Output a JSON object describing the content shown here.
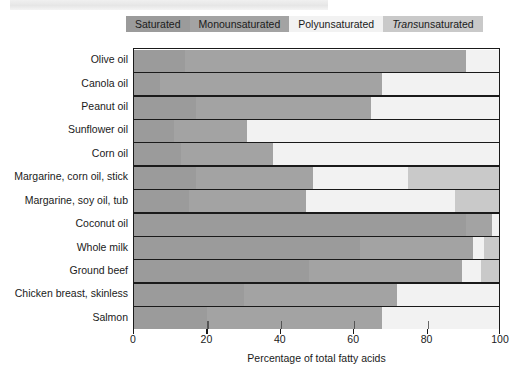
{
  "banner": {
    "present": true
  },
  "legend": {
    "items": [
      {
        "key": "saturated",
        "label": "Saturated",
        "color": "#9b9b9b",
        "italic_prefix": ""
      },
      {
        "key": "monounsaturated",
        "label": "Monounsaturated",
        "color": "#a3a3a3",
        "italic_prefix": ""
      },
      {
        "key": "polyunsaturated",
        "label": "Polyunsaturated",
        "color": "#f2f2f2",
        "italic_prefix": ""
      },
      {
        "key": "trans",
        "label": " unsaturated",
        "color": "#c9c9c9",
        "italic_prefix": "Trans"
      }
    ]
  },
  "axis": {
    "x_title": "Percentage of total fatty acids",
    "x_ticks": [
      0,
      20,
      40,
      60,
      80,
      100
    ],
    "x_tick_labels": [
      "0",
      "20",
      "40",
      "60",
      "80",
      "100"
    ]
  },
  "chart_data": {
    "type": "bar",
    "orientation": "horizontal",
    "stacked": true,
    "title": "",
    "xlabel": "Percentage of total fatty acids",
    "ylabel": "",
    "xlim": [
      0,
      100
    ],
    "grid": false,
    "legend_position": "top",
    "categories": [
      "Olive oil",
      "Canola oil",
      "Peanut oil",
      "Sunflower oil",
      "Corn oil",
      "Margarine, corn oil, stick",
      "Margarine, soy oil, tub",
      "Coconut oil",
      "Whole milk",
      "Ground beef",
      "Chicken breast, skinless",
      "Salmon"
    ],
    "series": [
      {
        "name": "Saturated",
        "color": "#9b9b9b",
        "values": [
          14,
          7,
          17,
          11,
          13,
          17,
          15,
          91,
          62,
          48,
          30,
          20
        ]
      },
      {
        "name": "Monounsaturated",
        "color": "#a3a3a3",
        "values": [
          77,
          61,
          48,
          20,
          25,
          32,
          32,
          7,
          31,
          42,
          42,
          48
        ]
      },
      {
        "name": "Polyunsaturated",
        "color": "#f2f2f2",
        "values": [
          9,
          32,
          35,
          69,
          62,
          26,
          41,
          2,
          3,
          5,
          28,
          32
        ]
      },
      {
        "name": "Trans unsaturated",
        "color": "#c9c9c9",
        "values": [
          0,
          0,
          0,
          0,
          0,
          25,
          12,
          0,
          4,
          5,
          0,
          0
        ]
      }
    ]
  }
}
